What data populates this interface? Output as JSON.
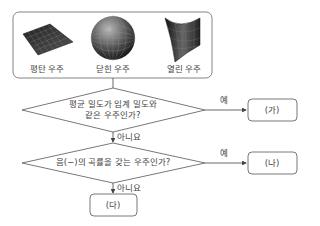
{
  "universes": [
    {
      "label": "평탄 우주",
      "icon": "flat-surface-icon"
    },
    {
      "label": "닫힌 우주",
      "icon": "sphere-icon"
    },
    {
      "label": "열린 우주",
      "icon": "saddle-surface-icon"
    }
  ],
  "decision1": {
    "line1": "평균 밀도가 임계 밀도와",
    "line2": "같은 우주인가?",
    "yes_label": "예",
    "no_label": "아니요"
  },
  "decision2": {
    "text": "음(−)의 곡률을 갖는 우주인가?",
    "yes_label": "예",
    "no_label": "아니요"
  },
  "results": {
    "a": "(가)",
    "b": "(나)",
    "c": "(다)"
  }
}
